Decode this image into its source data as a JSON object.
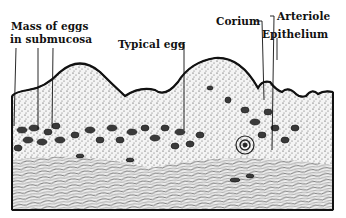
{
  "figure": {
    "type": "histological cross-section illustration",
    "ink_color": "#111111",
    "background": "#ffffff"
  },
  "labels": {
    "mass_of_eggs_line1": "Mass of eggs",
    "mass_of_eggs_line2": "in submucosa",
    "typical_egg": "Typical egg",
    "corium": "Corium",
    "arteriole": "Arteriole",
    "epithelium": "Epithelium"
  }
}
